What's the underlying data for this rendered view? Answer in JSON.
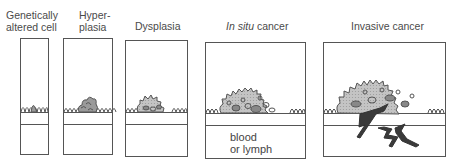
{
  "diagram": {
    "stages": [
      {
        "id": "genetically-altered-cell",
        "label_line1": "Genetically",
        "label_line2": "altered cell"
      },
      {
        "id": "hyperplasia",
        "label_line1": "Hyper-",
        "label_line2": "plasia"
      },
      {
        "id": "dysplasia",
        "label_line1": "Dysplasia"
      },
      {
        "id": "in-situ-cancer",
        "label_italic": "In situ",
        "label_rest": " cancer",
        "annotation_line1": "blood",
        "annotation_line2": "or lymph"
      },
      {
        "id": "invasive-cancer",
        "label_line1": "Invasive cancer"
      }
    ],
    "colors": {
      "outline": "#555555",
      "cell_fill": "#b8b8b8",
      "nucleus_fill": "#8a8a8a",
      "invasive_fill": "#3a3a3a",
      "background": "#ffffff"
    }
  }
}
